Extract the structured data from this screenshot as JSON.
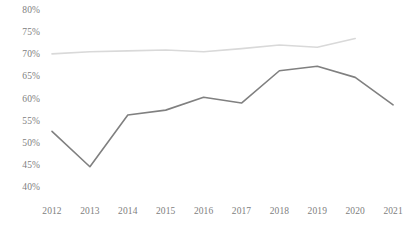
{
  "chart_data": {
    "type": "line",
    "title": "",
    "subtitle": "",
    "xlabel": "",
    "ylabel": "",
    "categories": [
      "2012",
      "2013",
      "2014",
      "2015",
      "2016",
      "2017",
      "2018",
      "2019",
      "2020",
      "2021"
    ],
    "ylim": [
      40,
      80
    ],
    "ytick_labels": [
      "80%",
      "75%",
      "70%",
      "65%",
      "60%",
      "55%",
      "50%",
      "45%",
      "40%"
    ],
    "ytick_values": [
      80,
      75,
      70,
      65,
      60,
      55,
      50,
      45,
      40
    ],
    "grid": false,
    "legend": "none",
    "series": [
      {
        "name": "upper-series",
        "color": "#d9d9d9",
        "values": [
          70.3,
          70.8,
          71.0,
          71.2,
          70.8,
          71.5,
          72.3,
          71.8,
          73.8,
          null
        ]
      },
      {
        "name": "lower-series",
        "color": "#808080",
        "values": [
          52.8,
          44.8,
          56.5,
          57.6,
          60.5,
          59.2,
          66.5,
          67.5,
          65.0,
          58.8
        ]
      }
    ]
  },
  "axes": {
    "y": {
      "ticks": [
        {
          "label": "80%",
          "value": 80
        },
        {
          "label": "75%",
          "value": 75
        },
        {
          "label": "70%",
          "value": 70
        },
        {
          "label": "65%",
          "value": 65
        },
        {
          "label": "60%",
          "value": 60
        },
        {
          "label": "55%",
          "value": 55
        },
        {
          "label": "50%",
          "value": 50
        },
        {
          "label": "45%",
          "value": 45
        },
        {
          "label": "40%",
          "value": 40
        }
      ]
    },
    "x": {
      "ticks": [
        {
          "label": "2012"
        },
        {
          "label": "2013"
        },
        {
          "label": "2014"
        },
        {
          "label": "2015"
        },
        {
          "label": "2016"
        },
        {
          "label": "2017"
        },
        {
          "label": "2018"
        },
        {
          "label": "2019"
        },
        {
          "label": "2020"
        },
        {
          "label": "2021"
        }
      ]
    }
  },
  "style": {
    "background": "#ffffff",
    "tick_label_color": "#808080",
    "upper_line_color": "#d9d9d9",
    "lower_line_color": "#808080"
  }
}
